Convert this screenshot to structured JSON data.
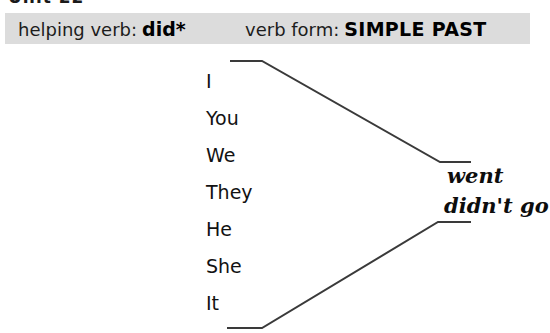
{
  "heading": {
    "fragment_text": "Unit 22"
  },
  "banner": {
    "background_color": "#dcdcdc",
    "helping_verb": {
      "label": "helping verb:",
      "value": "did*"
    },
    "verb_form": {
      "label": "verb form:",
      "value": "SIMPLE PAST"
    }
  },
  "subjects": [
    {
      "label": "I"
    },
    {
      "label": "You"
    },
    {
      "label": "We"
    },
    {
      "label": "They"
    },
    {
      "label": "He"
    },
    {
      "label": "She"
    },
    {
      "label": "It"
    }
  ],
  "verb_forms": {
    "affirmative": "went",
    "negative": "didn't go"
  },
  "connectors": {
    "line_color": "#3a3a3a",
    "top_bracket": "M231,61 L262,61 L440,162 L470,162",
    "bottom_bracket": "M228,328 L262,328 L438,222 L470,222"
  }
}
